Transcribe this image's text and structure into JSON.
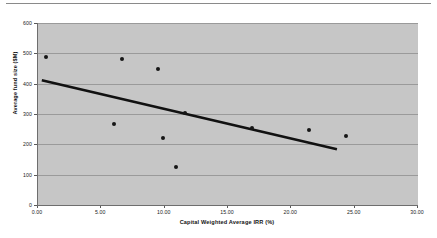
{
  "chart_data": {
    "type": "scatter",
    "title": "",
    "xlabel": "Capital Weighted Average IRR (%)",
    "ylabel": "Average fund size ($M)",
    "xlim": [
      0,
      30
    ],
    "ylim": [
      0,
      600
    ],
    "xticks": [
      "0.00",
      "5.00",
      "10.00",
      "15.00",
      "20.00",
      "25.00",
      "30.00"
    ],
    "xtick_values": [
      0,
      5,
      10,
      15,
      20,
      25,
      30
    ],
    "yticks": [
      "0",
      "100",
      "200",
      "300",
      "400",
      "500",
      "600"
    ],
    "ytick_values": [
      0,
      100,
      200,
      300,
      400,
      500,
      600
    ],
    "grid": "horizontal",
    "legend": "none",
    "points": [
      {
        "x": 0.6,
        "y": 487
      },
      {
        "x": 6.6,
        "y": 481
      },
      {
        "x": 9.5,
        "y": 450
      },
      {
        "x": 11.6,
        "y": 303
      },
      {
        "x": 6.0,
        "y": 266
      },
      {
        "x": 16.9,
        "y": 255
      },
      {
        "x": 21.4,
        "y": 248
      },
      {
        "x": 24.3,
        "y": 226
      },
      {
        "x": 9.9,
        "y": 222
      },
      {
        "x": 10.9,
        "y": 126
      }
    ],
    "trendline": {
      "label": "linear-trend",
      "x_start": 0.3,
      "y_start": 411,
      "x_end": 23.6,
      "y_end": 184
    },
    "colors": {
      "plot_background": "#c6c6c6",
      "gridline": "#9a9a9a",
      "axis": "#6e6e6e",
      "marker": "#161616",
      "trendline": "#111111",
      "text": "#1a1a1a",
      "page_background": "#ffffff"
    }
  }
}
